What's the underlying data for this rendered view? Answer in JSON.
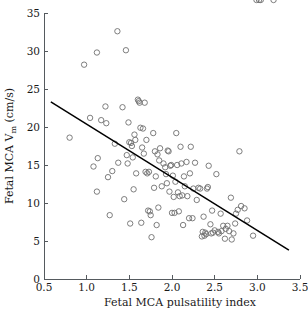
{
  "chart_data": {
    "type": "scatter",
    "title": "",
    "xlabel": "Fetal MCA pulsatility index",
    "ylabel": "Fetal MCA V",
    "ylabel_sub": "m",
    "ylabel_units": " (cm/s)",
    "xlim": [
      0.5,
      3.5
    ],
    "ylim": [
      0,
      35
    ],
    "xticks": [
      "0.5",
      "1.0",
      "1.5",
      "2.0",
      "2.5",
      "3.0",
      "3.5"
    ],
    "xtick_values": [
      0.5,
      1.0,
      1.5,
      2.0,
      2.5,
      3.0,
      3.5
    ],
    "yticks": [
      "0",
      "5",
      "10",
      "15",
      "20",
      "25",
      "30",
      "35"
    ],
    "ytick_values": [
      0,
      5,
      10,
      15,
      20,
      25,
      30,
      35
    ],
    "grid": false,
    "legend": false,
    "marker": "open-circle",
    "marker_color": "#6f6f6f",
    "fit_line": {
      "type": "linear-regression",
      "color": "#000000",
      "x_start": 0.58,
      "y_start": 23.3,
      "x_end": 3.37,
      "y_end": 3.8
    },
    "x": [
      0.8,
      0.97,
      1.04,
      1.08,
      1.12,
      1.12,
      1.13,
      1.17,
      1.22,
      1.23,
      1.25,
      1.27,
      1.3,
      1.33,
      1.36,
      1.37,
      1.42,
      1.44,
      1.46,
      1.47,
      1.48,
      1.49,
      1.5,
      1.51,
      1.52,
      1.53,
      1.54,
      1.55,
      1.56,
      1.57,
      1.58,
      1.6,
      1.61,
      1.62,
      1.63,
      1.64,
      1.65,
      1.66,
      1.67,
      1.68,
      1.69,
      1.7,
      1.71,
      1.72,
      1.73,
      1.74,
      1.75,
      1.76,
      1.78,
      1.79,
      1.8,
      1.81,
      1.82,
      1.83,
      1.84,
      1.85,
      1.86,
      1.88,
      1.9,
      1.92,
      1.93,
      1.94,
      1.95,
      1.96,
      1.97,
      1.98,
      1.99,
      2.0,
      2.01,
      2.02,
      2.03,
      2.04,
      2.05,
      2.06,
      2.07,
      2.08,
      2.09,
      2.1,
      2.11,
      2.12,
      2.13,
      2.14,
      2.15,
      2.17,
      2.18,
      2.2,
      2.21,
      2.22,
      2.24,
      2.25,
      2.27,
      2.29,
      2.31,
      2.33,
      2.35,
      2.36,
      2.37,
      2.38,
      2.39,
      2.4,
      2.41,
      2.42,
      2.43,
      2.45,
      2.46,
      2.47,
      2.48,
      2.5,
      2.52,
      2.54,
      2.55,
      2.57,
      2.58,
      2.6,
      2.62,
      2.63,
      2.65,
      2.67,
      2.69,
      2.7,
      2.72,
      2.74,
      2.75,
      2.77,
      2.79,
      2.81,
      2.85,
      2.88,
      2.95,
      2.99,
      3.02,
      3.04,
      3.19
    ],
    "y": [
      18.6,
      28.2,
      21.2,
      14.8,
      29.8,
      11.5,
      15.9,
      20.9,
      22.7,
      20.5,
      13.4,
      8.4,
      14.2,
      17.8,
      32.6,
      15.3,
      22.6,
      10.5,
      30.1,
      16.3,
      15.2,
      20.6,
      18.0,
      7.3,
      17.9,
      17.5,
      16.0,
      11.8,
      19.0,
      18.3,
      13.9,
      23.6,
      23.4,
      23.2,
      19.9,
      7.4,
      17.3,
      19.8,
      16.5,
      23.2,
      14.1,
      18.3,
      13.9,
      9.0,
      14.1,
      8.9,
      8.4,
      5.5,
      19.2,
      12.0,
      16.8,
      13.5,
      7.1,
      16.4,
      9.4,
      15.6,
      17.2,
      12.2,
      15.2,
      14.7,
      13.8,
      12.6,
      16.9,
      16.8,
      11.5,
      14.9,
      15.0,
      8.7,
      13.6,
      10.8,
      8.7,
      12.8,
      19.2,
      15.0,
      11.4,
      8.9,
      10.9,
      17.4,
      15.2,
      11.0,
      7.1,
      13.5,
      12.2,
      15.4,
      10.9,
      8.0,
      13.9,
      17.4,
      8.0,
      11.9,
      15.3,
      10.4,
      12.0,
      11.9,
      5.6,
      6.2,
      8.2,
      5.7,
      6.1,
      5.9,
      11.9,
      12.1,
      14.9,
      7.2,
      6.0,
      9.0,
      6.1,
      6.4,
      13.8,
      6.2,
      6.0,
      8.6,
      6.3,
      7.0,
      5.3,
      6.6,
      7.0,
      6.3,
      10.7,
      5.2,
      6.0,
      7.3,
      8.6,
      9.1,
      16.8,
      9.6,
      9.3,
      7.7,
      5.7
    ],
    "n_points": 131
  },
  "figure": {
    "background_color": "#ffffff",
    "axis_color": "#555a5e"
  }
}
